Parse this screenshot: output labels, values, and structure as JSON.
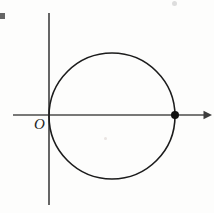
{
  "figure": {
    "kind": "coordinate-geometry-diagram",
    "background_color": "#fdfdfc",
    "stroke_color": "#1c1c1c",
    "axis_color": "#4b4b4b",
    "width": 214,
    "height": 213,
    "origin_label": "O"
  },
  "chart_data": {
    "type": "scatter",
    "title": "",
    "xlabel": "",
    "ylabel": "",
    "grid": false,
    "legend": null,
    "axes": {
      "origin_px": [
        49,
        115
      ],
      "x_axis": {
        "start_px": [
          13,
          115
        ],
        "end_px": [
          212,
          115
        ],
        "arrow_at_end": true,
        "tick_labels": []
      },
      "y_axis": {
        "start_px": [
          49,
          13
        ],
        "end_px": [
          49,
          205
        ],
        "arrow_at_end": false,
        "tick_labels": []
      }
    },
    "shapes": [
      {
        "name": "circle",
        "type": "circle",
        "center_px": [
          112,
          116
        ],
        "radius_px": 63,
        "stroke": "#1c1c1c",
        "stroke_width": 1.6,
        "fill": "none",
        "tangent_to": "y-axis at origin"
      }
    ],
    "points": [
      {
        "name": "x-axis-intersection-point",
        "x_px": 175,
        "y_px": 115,
        "marker": "filled-circle",
        "radius_px": 4,
        "color": "#111111",
        "label": ""
      }
    ],
    "annotations": [
      {
        "name": "origin-label",
        "text": "O",
        "x_px": 40,
        "y_px": 124,
        "style": "italic-serif"
      }
    ]
  }
}
